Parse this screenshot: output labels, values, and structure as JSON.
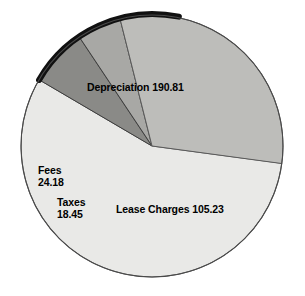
{
  "chart_data": {
    "type": "pie",
    "title": "",
    "subtitle": "",
    "xlabel": "",
    "ylabel": "",
    "legend": "none",
    "grid": false,
    "labels_on_slices": true,
    "total": 338.67,
    "categories": [
      "Depreciation",
      "Lease Charges",
      "Taxes",
      "Fees"
    ],
    "values": [
      190.81,
      105.23,
      18.45,
      24.18
    ],
    "colors": [
      "#e9e9e7",
      "#bdbdba",
      "#a8a8a5",
      "#8a8a87"
    ],
    "slices": [
      {
        "name": "Depreciation",
        "value": 190.81,
        "value_text": "190.81",
        "label_text": "Depreciation 190.81",
        "percent": 56.34,
        "start_angle": 7.6,
        "sweep_angle": 202.8,
        "color": "#e9e9e7"
      },
      {
        "name": "Lease Charges",
        "value": 105.23,
        "value_text": "105.23",
        "label_text": "Lease Charges 105.23",
        "percent": 31.07,
        "start_angle": 255.9,
        "sweep_angle": 111.8,
        "color": "#bdbdba"
      },
      {
        "name": "Taxes",
        "value": 18.45,
        "value_text": "18.45",
        "label_line1": "Taxes",
        "label_line2": "18.45",
        "percent": 5.45,
        "start_angle": 236.3,
        "sweep_angle": 19.6,
        "color": "#a8a8a5"
      },
      {
        "name": "Fees",
        "value": 24.18,
        "value_text": "24.18",
        "label_line1": "Fees",
        "label_line2": "24.18",
        "percent": 7.14,
        "start_angle": 210.4,
        "sweep_angle": 25.9,
        "color": "#8a8a87"
      }
    ]
  },
  "chart": {
    "center_x": 152,
    "center_y": 146,
    "radius": 131,
    "outline_color": "#4a4a4a",
    "highlight_arc_color": "#111111",
    "background": "#ffffff"
  },
  "labels": {
    "depreciation": "Depreciation 190.81",
    "lease_charges": "Lease Charges 105.23",
    "fees_line1": "Fees",
    "fees_line2": "24.18",
    "taxes_line1": "Taxes",
    "taxes_line2": "18.45"
  }
}
